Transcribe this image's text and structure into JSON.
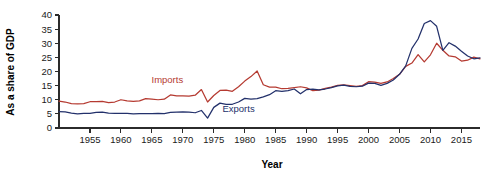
{
  "chart_data": {
    "type": "line",
    "title": "",
    "xlabel": "Year",
    "ylabel": "As a share of GDP",
    "xlim": [
      1950,
      2018
    ],
    "ylim": [
      0,
      40
    ],
    "grid": false,
    "legend_position": "inline-annotation",
    "xticks": [
      1955,
      1960,
      1965,
      1970,
      1975,
      1980,
      1985,
      1990,
      1995,
      2000,
      2005,
      2010,
      2015
    ],
    "xtick_labels": [
      "1955",
      "1960",
      "1965",
      "1970",
      "1975",
      "1980",
      "1985",
      "1990",
      "1995",
      "2000",
      "2005",
      "2010",
      "2015"
    ],
    "yticks": [
      0,
      5,
      10,
      15,
      20,
      25,
      30,
      35,
      40
    ],
    "ytick_labels": [
      "0",
      "5",
      "10",
      "15",
      "20",
      "25",
      "30",
      "35",
      "40"
    ],
    "colors": {
      "imports": "#B53A31",
      "exports": "#23316B",
      "axis": "#2b2b2b",
      "text": "#111111",
      "background": "#FFFFFF"
    },
    "annotations": [
      {
        "name": "imports-label",
        "text": "Imports",
        "x": 1967.5,
        "y": 16.0,
        "color": "#B53A31"
      },
      {
        "name": "exports-label",
        "text": "Exports",
        "x": 1979.0,
        "y": 5.6,
        "color": "#23316B"
      }
    ],
    "x": [
      1950,
      1951,
      1952,
      1953,
      1954,
      1955,
      1956,
      1957,
      1958,
      1959,
      1960,
      1961,
      1962,
      1963,
      1964,
      1965,
      1966,
      1967,
      1968,
      1969,
      1970,
      1971,
      1972,
      1973,
      1974,
      1975,
      1976,
      1977,
      1978,
      1979,
      1980,
      1981,
      1982,
      1983,
      1984,
      1985,
      1986,
      1987,
      1988,
      1989,
      1990,
      1991,
      1992,
      1993,
      1994,
      1995,
      1996,
      1997,
      1998,
      1999,
      2000,
      2001,
      2002,
      2003,
      2004,
      2005,
      2006,
      2007,
      2008,
      2009,
      2010,
      2011,
      2012,
      2013,
      2014,
      2015,
      2016,
      2017,
      2018
    ],
    "series": [
      {
        "name": "Imports",
        "color": "#B53A31",
        "values": [
          9.5,
          9.2,
          8.6,
          8.5,
          8.6,
          9.3,
          9.3,
          9.4,
          9.0,
          9.2,
          10.0,
          9.6,
          9.4,
          9.6,
          10.4,
          10.2,
          10.0,
          10.2,
          11.7,
          11.4,
          11.4,
          11.3,
          11.6,
          13.6,
          9.2,
          11.5,
          13.3,
          13.4,
          13.0,
          14.6,
          16.6,
          18.2,
          20.2,
          15.3,
          14.5,
          14.5,
          13.9,
          14.0,
          14.3,
          14.6,
          14.2,
          13.2,
          13.4,
          14.0,
          14.5,
          15.1,
          15.3,
          15.0,
          14.7,
          15.0,
          16.4,
          16.2,
          15.8,
          16.3,
          17.5,
          19.0,
          21.8,
          23.0,
          26.0,
          23.4,
          25.9,
          30.0,
          27.5,
          25.5,
          25.2,
          23.7,
          24.0,
          25.1,
          24.5
        ]
      },
      {
        "name": "Exports",
        "color": "#23316B",
        "values": [
          5.8,
          5.7,
          5.3,
          5.0,
          5.2,
          5.2,
          5.5,
          5.6,
          5.3,
          5.2,
          5.2,
          5.2,
          5.0,
          5.1,
          5.1,
          5.1,
          5.2,
          5.1,
          5.5,
          5.6,
          5.7,
          5.6,
          5.4,
          6.2,
          3.5,
          7.3,
          8.8,
          8.4,
          8.4,
          9.2,
          10.5,
          10.2,
          10.4,
          11.0,
          11.8,
          13.2,
          13.0,
          13.2,
          13.8,
          12.1,
          13.6,
          13.8,
          13.5,
          13.8,
          14.3,
          14.9,
          15.2,
          14.7,
          14.6,
          14.8,
          15.9,
          15.8,
          15.1,
          15.8,
          17.0,
          19.0,
          22.0,
          28.2,
          31.5,
          37.0,
          38.0,
          36.0,
          27.5,
          30.2,
          29.0,
          27.2,
          25.5,
          24.5,
          24.8
        ]
      }
    ]
  }
}
